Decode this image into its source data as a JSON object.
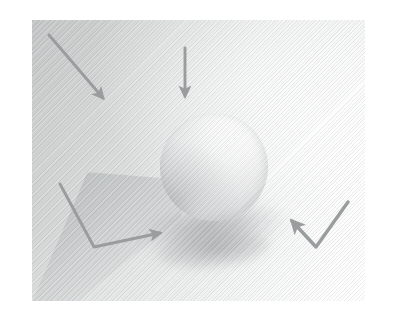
{
  "figure": {
    "kind": "shading-illustration",
    "description": "Grayscale rendered scene: a matte sphere resting on a ground plane, lit from the upper right, with a soft cast shadow to the lower left and four gray annotation arrows indicating light and shadow directions.",
    "canvas": {
      "width": 400,
      "height": 324,
      "background": "#ffffff"
    },
    "panel": {
      "x": 32,
      "y": 20,
      "width": 333,
      "height": 281
    }
  },
  "colors": {
    "page_background": "#ffffff",
    "scene_light": "#ffffff",
    "scene_mid": "#e2e4e4",
    "scene_dark": "#c9cbcb",
    "arrow": "#9a9d9e",
    "sphere_highlight": "#ffffff",
    "sphere_mid": "#eaebec",
    "sphere_terminator": "#c2c4c6",
    "shadow": "#8e9294",
    "ground_wedge": "#a9adae"
  },
  "scene": {
    "sphere": {
      "label": "sphere",
      "center_x": 214,
      "center_y": 167,
      "radius": 54,
      "highlight_x": 66,
      "highlight_y": 24
    },
    "cast_shadow": {
      "label": "cast-shadow",
      "center_x": 195,
      "center_y": 231,
      "width": 190,
      "height": 62,
      "rotation": -7
    },
    "ground_plane": {
      "label": "ground-plane-wedge",
      "x": 32,
      "y": 172,
      "width": 150,
      "height": 130
    },
    "texture": {
      "label": "diagonal-hatching",
      "angle": -45,
      "spacing": 2.6
    }
  },
  "arrows": [
    {
      "id": "arrow-top-left",
      "name": "light-direction-arrow-diagonal",
      "kind": "straight",
      "description": "Diagonal arrow pointing down and to the right",
      "direction": "down-right",
      "start_x": 17,
      "start_y": 15,
      "end_x": 71,
      "end_y": 78
    },
    {
      "id": "arrow-top-center",
      "name": "light-direction-arrow-vertical",
      "kind": "straight",
      "description": "Vertical arrow pointing straight down",
      "direction": "down",
      "start_x": 153,
      "start_y": 28,
      "end_x": 153,
      "end_y": 76
    },
    {
      "id": "arrow-bottom-left",
      "name": "shadow-direction-arrow-bent-right",
      "kind": "bent",
      "description": "Bent arrow descending from upper left then turning right, arrowhead pointing right",
      "direction": "down-then-right",
      "start_x": 28,
      "start_y": 164,
      "corner_x": 62,
      "corner_y": 227,
      "end_x": 128,
      "end_y": 213
    },
    {
      "id": "arrow-bottom-right",
      "name": "shadow-direction-arrow-checkmark",
      "kind": "bent",
      "description": "Check-mark shaped arrow descending from upper right then turning up-left, arrowhead pointing up-left",
      "direction": "down-then-up-left",
      "start_x": 316,
      "start_y": 182,
      "corner_x": 284,
      "corner_y": 227,
      "end_x": 260,
      "end_y": 201
    }
  ],
  "chart_data": {
    "type": "scatter",
    "title": "",
    "xlabel": "",
    "ylabel": "",
    "annotations": [
      "down-right diagonal arrow (upper left)",
      "downward vertical arrow (upper center)",
      "bent arrow turning right (lower left)",
      "check-mark arrow turning up-left (lower right)"
    ]
  }
}
